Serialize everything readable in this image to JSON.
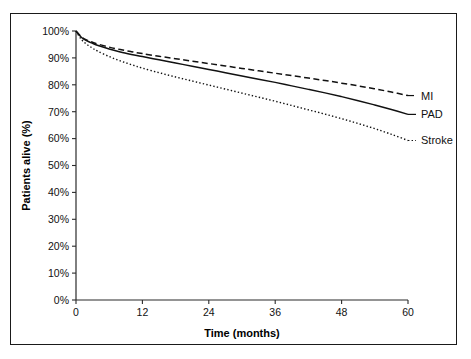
{
  "figure": {
    "background": "#ffffff",
    "frame_color": "#1a1a1a",
    "line_color": "#111111"
  },
  "chart_data": {
    "type": "line",
    "title": "",
    "subtitle": "",
    "xlabel": "Time (months)",
    "ylabel": "Patients alive (%)",
    "xlim": [
      0,
      60
    ],
    "ylim": [
      0,
      100
    ],
    "grid": false,
    "legend_position": "right-inline-labels",
    "xticks": [
      0,
      12,
      24,
      36,
      48,
      60
    ],
    "xticklabels": [
      "0",
      "12",
      "24",
      "36",
      "48",
      "60"
    ],
    "yticks": [
      0,
      10,
      20,
      30,
      40,
      50,
      60,
      70,
      80,
      90,
      100
    ],
    "yticklabels": [
      "0%",
      "10%",
      "20%",
      "30%",
      "40%",
      "50%",
      "60%",
      "70%",
      "80%",
      "90%",
      "100%"
    ],
    "x": [
      0,
      1,
      2,
      3,
      4,
      6,
      8,
      10,
      12,
      15,
      18,
      21,
      24,
      27,
      30,
      33,
      36,
      39,
      42,
      45,
      48,
      51,
      54,
      57,
      60
    ],
    "series": [
      {
        "name": "MI",
        "label": "MI",
        "style": "dashed",
        "color": "#111111",
        "values": [
          100.0,
          97.8,
          96.6,
          95.8,
          95.1,
          94.0,
          93.1,
          92.3,
          91.6,
          90.6,
          89.7,
          88.8,
          87.9,
          87.0,
          86.1,
          85.2,
          84.3,
          83.4,
          82.5,
          81.6,
          80.6,
          79.6,
          78.5,
          77.3,
          76.0
        ]
      },
      {
        "name": "PAD",
        "label": "PAD",
        "style": "solid",
        "color": "#111111",
        "values": [
          100.0,
          97.6,
          96.3,
          95.4,
          94.6,
          93.3,
          92.2,
          91.3,
          90.5,
          89.3,
          88.1,
          86.9,
          85.7,
          84.5,
          83.3,
          82.1,
          80.9,
          79.6,
          78.3,
          77.0,
          75.6,
          74.1,
          72.5,
          70.8,
          69.0
        ]
      },
      {
        "name": "Stroke",
        "label": "Stroke",
        "style": "dotted",
        "color": "#111111",
        "values": [
          100.0,
          96.8,
          95.0,
          93.6,
          92.4,
          90.5,
          88.9,
          87.5,
          86.2,
          84.5,
          82.9,
          81.4,
          79.9,
          78.4,
          76.9,
          75.4,
          73.9,
          72.3,
          70.7,
          69.1,
          67.4,
          65.6,
          63.7,
          61.6,
          59.3
        ]
      }
    ],
    "annotations": [
      {
        "text": "MI",
        "attached_to": "MI",
        "at_x": 60
      },
      {
        "text": "PAD",
        "attached_to": "PAD",
        "at_x": 60
      },
      {
        "text": "Stroke",
        "attached_to": "Stroke",
        "at_x": 60
      }
    ]
  },
  "geometry": {
    "plot_left": 76,
    "plot_right": 408,
    "plot_top": 31,
    "plot_bottom": 300
  }
}
